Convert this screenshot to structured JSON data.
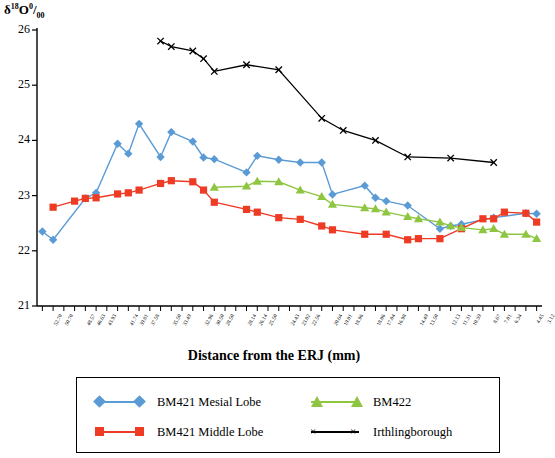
{
  "axis": {
    "y_label_main": "δ",
    "y_label_sup": "18",
    "y_label_o": "O",
    "y_label_permil_num": "0",
    "y_label_permil_den": "00",
    "y_label_full": "δ18O0/00",
    "x_title": "Distance from the ERJ (mm)",
    "y_ticks": [
      "21",
      "22",
      "23",
      "24",
      "25",
      "26"
    ],
    "y_min": 21,
    "y_max": 26
  },
  "legend": {
    "entries": [
      {
        "label": "BM421 Mesial Lobe",
        "color": "#5b9bd5",
        "marker": "diamond"
      },
      {
        "label": "BM421 Middle Lobe",
        "color": "#ee3b24",
        "marker": "square"
      },
      {
        "label": "BM422",
        "color": "#8ec641",
        "marker": "triangle"
      },
      {
        "label": "Irthlingborough",
        "color": "#000000",
        "marker": "x"
      }
    ]
  },
  "chart_data": {
    "type": "line",
    "title": "",
    "xlabel": "Distance from the ERJ (mm)",
    "ylabel": "δ18O ‰",
    "ylim": [
      21,
      26
    ],
    "grid": false,
    "legend_position": "bottom",
    "categories": [
      "52.70",
      "50.70",
      "48.57",
      "46.63",
      "43.93",
      "41.74",
      "39.81",
      "37.58",
      "35.50",
      "33.49",
      "32.96",
      "30.50",
      "28.50",
      "28.14",
      "26.14",
      "25.50",
      "24.43",
      "23.02",
      "22.56",
      "20.64",
      "19.01",
      "18.96",
      "18.06",
      "17.04",
      "16.98",
      "14.49",
      "13.50",
      "12.13",
      "11.31",
      "10.39",
      "8.67",
      "7.01",
      "6.34",
      "4.45",
      "3.12"
    ],
    "series": [
      {
        "name": "BM421 Mesial Lobe",
        "color": "#5b9bd5",
        "marker": "diamond",
        "points": [
          {
            "x": "52.70",
            "y": 22.35
          },
          {
            "x": "50.70",
            "y": 22.2
          },
          {
            "x": "46.63",
            "y": 22.95
          },
          {
            "x": "43.93",
            "y": 23.05
          },
          {
            "x": "41.74",
            "y": 23.94
          },
          {
            "x": "39.81",
            "y": 23.76
          },
          {
            "x": "37.58",
            "y": 24.3
          },
          {
            "x": "35.50",
            "y": 23.7
          },
          {
            "x": "33.49",
            "y": 24.15
          },
          {
            "x": "32.96",
            "y": 23.98
          },
          {
            "x": "30.50",
            "y": 23.69
          },
          {
            "x": "28.50",
            "y": 23.66
          },
          {
            "x": "26.14",
            "y": 23.42
          },
          {
            "x": "25.50",
            "y": 23.72
          },
          {
            "x": "24.43",
            "y": 23.65
          },
          {
            "x": "22.56",
            "y": 23.6
          },
          {
            "x": "20.64",
            "y": 23.6
          },
          {
            "x": "19.01",
            "y": 23.02
          },
          {
            "x": "18.06",
            "y": 23.18
          },
          {
            "x": "17.04",
            "y": 22.96
          },
          {
            "x": "16.98",
            "y": 22.9
          },
          {
            "x": "14.49",
            "y": 22.82
          },
          {
            "x": "12.13",
            "y": 22.4
          },
          {
            "x": "11.31",
            "y": 22.45
          },
          {
            "x": "10.39",
            "y": 22.48
          },
          {
            "x": "7.01",
            "y": 22.6
          },
          {
            "x": "4.45",
            "y": 22.68
          },
          {
            "x": "3.12",
            "y": 22.67
          }
        ]
      },
      {
        "name": "BM421 Middle Lobe",
        "color": "#ee3b24",
        "marker": "square",
        "points": [
          {
            "x": "50.70",
            "y": 22.79
          },
          {
            "x": "48.57",
            "y": 22.9
          },
          {
            "x": "46.63",
            "y": 22.95
          },
          {
            "x": "43.93",
            "y": 22.96
          },
          {
            "x": "41.74",
            "y": 23.03
          },
          {
            "x": "39.81",
            "y": 23.05
          },
          {
            "x": "37.58",
            "y": 23.1
          },
          {
            "x": "35.50",
            "y": 23.22
          },
          {
            "x": "33.49",
            "y": 23.27
          },
          {
            "x": "32.96",
            "y": 23.25
          },
          {
            "x": "30.50",
            "y": 23.1
          },
          {
            "x": "28.50",
            "y": 22.88
          },
          {
            "x": "26.14",
            "y": 22.75
          },
          {
            "x": "25.50",
            "y": 22.7
          },
          {
            "x": "24.43",
            "y": 22.6
          },
          {
            "x": "22.56",
            "y": 22.57
          },
          {
            "x": "20.64",
            "y": 22.45
          },
          {
            "x": "19.01",
            "y": 22.38
          },
          {
            "x": "18.06",
            "y": 22.3
          },
          {
            "x": "16.98",
            "y": 22.3
          },
          {
            "x": "14.49",
            "y": 22.2
          },
          {
            "x": "13.50",
            "y": 22.22
          },
          {
            "x": "12.13",
            "y": 22.22
          },
          {
            "x": "10.39",
            "y": 22.4
          },
          {
            "x": "8.67",
            "y": 22.58
          },
          {
            "x": "7.01",
            "y": 22.58
          },
          {
            "x": "6.34",
            "y": 22.7
          },
          {
            "x": "4.45",
            "y": 22.68
          },
          {
            "x": "3.12",
            "y": 22.52
          }
        ]
      },
      {
        "name": "BM422",
        "color": "#8ec641",
        "marker": "triangle",
        "points": [
          {
            "x": "28.50",
            "y": 23.15
          },
          {
            "x": "26.14",
            "y": 23.17
          },
          {
            "x": "25.50",
            "y": 23.26
          },
          {
            "x": "24.43",
            "y": 23.25
          },
          {
            "x": "22.56",
            "y": 23.1
          },
          {
            "x": "20.64",
            "y": 22.98
          },
          {
            "x": "19.01",
            "y": 22.84
          },
          {
            "x": "18.06",
            "y": 22.78
          },
          {
            "x": "17.04",
            "y": 22.76
          },
          {
            "x": "16.98",
            "y": 22.7
          },
          {
            "x": "14.49",
            "y": 22.62
          },
          {
            "x": "13.50",
            "y": 22.58
          },
          {
            "x": "12.13",
            "y": 22.52
          },
          {
            "x": "11.31",
            "y": 22.45
          },
          {
            "x": "10.39",
            "y": 22.42
          },
          {
            "x": "8.67",
            "y": 22.38
          },
          {
            "x": "7.01",
            "y": 22.4
          },
          {
            "x": "6.34",
            "y": 22.3
          },
          {
            "x": "4.45",
            "y": 22.3
          },
          {
            "x": "3.12",
            "y": 22.22
          }
        ]
      },
      {
        "name": "Irthlingborough",
        "color": "#000000",
        "marker": "x",
        "points": [
          {
            "x": "35.50",
            "y": 25.8
          },
          {
            "x": "33.49",
            "y": 25.7
          },
          {
            "x": "32.96",
            "y": 25.62
          },
          {
            "x": "30.50",
            "y": 25.48
          },
          {
            "x": "28.50",
            "y": 25.25
          },
          {
            "x": "26.14",
            "y": 25.37
          },
          {
            "x": "24.43",
            "y": 25.28
          },
          {
            "x": "20.64",
            "y": 24.4
          },
          {
            "x": "18.96",
            "y": 24.18
          },
          {
            "x": "17.04",
            "y": 24.0
          },
          {
            "x": "14.49",
            "y": 23.7
          },
          {
            "x": "11.31",
            "y": 23.68
          },
          {
            "x": "7.01",
            "y": 23.6
          }
        ]
      }
    ]
  }
}
